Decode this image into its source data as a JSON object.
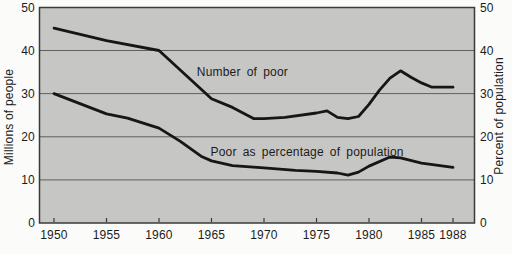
{
  "chart_data": {
    "type": "line",
    "title": "",
    "grid_on": true,
    "gridline_values": [
      10,
      20,
      30,
      40
    ],
    "x_axis": {
      "tick_years": [
        1950,
        1955,
        1960,
        1965,
        1970,
        1975,
        1980,
        1985,
        1988
      ],
      "range_years": [
        1948.6,
        1990.1
      ]
    },
    "y_axis_left": {
      "label": "Millions of people",
      "tick_values": [
        0,
        10,
        20,
        30,
        40,
        50
      ],
      "range": [
        0,
        50
      ]
    },
    "y_axis_right": {
      "label": "Percent of population",
      "tick_values": [
        0,
        10,
        20,
        30,
        40,
        50
      ],
      "range": [
        0,
        50
      ]
    },
    "series": [
      {
        "name": "Number of poor",
        "units": "millions of people",
        "points": [
          [
            1950,
            45.2
          ],
          [
            1955,
            42.3
          ],
          [
            1960,
            40.0
          ],
          [
            1965,
            28.8
          ],
          [
            1967,
            26.8
          ],
          [
            1969,
            24.2
          ],
          [
            1970,
            24.2
          ],
          [
            1972,
            24.5
          ],
          [
            1975,
            25.5
          ],
          [
            1976,
            26.0
          ],
          [
            1977,
            24.5
          ],
          [
            1978,
            24.2
          ],
          [
            1979,
            24.7
          ],
          [
            1980,
            27.5
          ],
          [
            1981,
            30.8
          ],
          [
            1982,
            33.6
          ],
          [
            1983,
            35.3
          ],
          [
            1984,
            33.8
          ],
          [
            1985,
            32.5
          ],
          [
            1986,
            31.5
          ],
          [
            1988,
            31.5
          ]
        ]
      },
      {
        "name": "Poor as percentage of population",
        "units": "percent of population",
        "points": [
          [
            1950,
            30.0
          ],
          [
            1955,
            25.3
          ],
          [
            1957,
            24.3
          ],
          [
            1960,
            22.0
          ],
          [
            1962,
            19.0
          ],
          [
            1964,
            15.5
          ],
          [
            1965,
            14.4
          ],
          [
            1967,
            13.3
          ],
          [
            1970,
            12.8
          ],
          [
            1973,
            12.2
          ],
          [
            1975,
            12.0
          ],
          [
            1977,
            11.6
          ],
          [
            1978,
            11.1
          ],
          [
            1979,
            11.8
          ],
          [
            1980,
            13.2
          ],
          [
            1982,
            15.3
          ],
          [
            1983,
            15.1
          ],
          [
            1985,
            13.9
          ],
          [
            1988,
            12.9
          ]
        ]
      }
    ],
    "annotations": [
      {
        "text": "Number of poor",
        "anchor_year": 1963.6,
        "anchor_value": 34.0
      },
      {
        "text": "Poor as percentage of population",
        "anchor_year": 1964.9,
        "anchor_value": 15.5
      }
    ],
    "colors": {
      "page_background": "#fbfbfa",
      "plot_background": "#c6c6c5",
      "line": "#161616",
      "gridline": "#5f5f5f",
      "border": "#3a3a3a",
      "text": "#1b1b1b"
    }
  }
}
